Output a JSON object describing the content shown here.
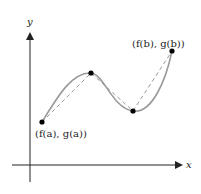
{
  "diagram": {
    "axes": {
      "x_label": "x",
      "y_label": "y"
    },
    "points": {
      "start": {
        "label": "(f(a), g(a))",
        "px": [
          42,
          122
        ]
      },
      "peak": {
        "px": [
          91,
          73
        ]
      },
      "valley": {
        "px": [
          133,
          111
        ]
      },
      "end": {
        "label": "(f(b), g(b))",
        "px": [
          172,
          51
        ]
      }
    },
    "colors": {
      "curve": "#9a9a9a",
      "chord": "#9a9a9a",
      "axis": "#222222",
      "point": "#000000"
    }
  }
}
